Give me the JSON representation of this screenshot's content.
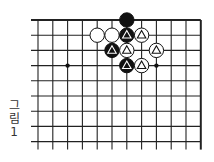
{
  "figure": {
    "caption_chars": [
      "그",
      "림",
      "1"
    ],
    "caption": "그림 1"
  },
  "board": {
    "visible_columns": 12,
    "visible_rows": 9,
    "edges": [
      "top",
      "right"
    ],
    "line_color": "#222222",
    "star_points": [
      {
        "col": 2,
        "row": 3
      },
      {
        "col": 8,
        "row": 3
      }
    ],
    "stones": [
      {
        "col": 6,
        "row": 0,
        "color": "black",
        "mark": "none"
      },
      {
        "col": 4,
        "row": 1,
        "color": "white",
        "mark": "none"
      },
      {
        "col": 5,
        "row": 1,
        "color": "white",
        "mark": "none"
      },
      {
        "col": 6,
        "row": 1,
        "color": "black",
        "mark": "triangle"
      },
      {
        "col": 7,
        "row": 1,
        "color": "white",
        "mark": "triangle"
      },
      {
        "col": 5,
        "row": 2,
        "color": "black",
        "mark": "triangle"
      },
      {
        "col": 6,
        "row": 2,
        "color": "white",
        "mark": "triangle"
      },
      {
        "col": 8,
        "row": 2,
        "color": "white",
        "mark": "triangle"
      },
      {
        "col": 6,
        "row": 3,
        "color": "black",
        "mark": "triangle"
      },
      {
        "col": 7,
        "row": 3,
        "color": "white",
        "mark": "triangle"
      }
    ]
  }
}
